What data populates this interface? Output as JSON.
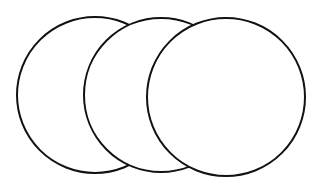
{
  "diagram": {
    "type": "overlapping-circles",
    "background": "#ffffff",
    "stroke": "#111111",
    "fill": "#ffffff",
    "circles": [
      {
        "name": "left-circle",
        "cx": 95,
        "cy": 95,
        "r": 78
      },
      {
        "name": "middle-circle",
        "cx": 161,
        "cy": 95,
        "r": 77
      },
      {
        "name": "right-circle",
        "cx": 226,
        "cy": 97,
        "r": 79
      }
    ]
  }
}
